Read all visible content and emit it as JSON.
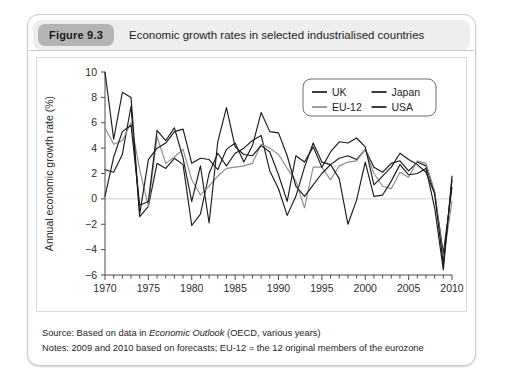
{
  "figure": {
    "badge": "Figure 9.3",
    "title": "Economic growth rates in selected industrialised countries"
  },
  "footer": {
    "source_prefix": "Source: Based on data in ",
    "source_italic": "Economic Outlook",
    "source_suffix": " (OECD, various years)",
    "notes": "Notes: 2009 and 2010 based on forecasts; EU-12 = the 12 original members of the eurozone"
  },
  "legend": {
    "position": "top-right",
    "entries": [
      {
        "label": "UK",
        "color": "#1a1a1a"
      },
      {
        "label": "Japan",
        "color": "#1a1a1a"
      },
      {
        "label": "EU-12",
        "color": "#8c8c8c"
      },
      {
        "label": "USA",
        "color": "#1a1a1a"
      }
    ]
  },
  "chart_data": {
    "type": "line",
    "title": "Economic growth rates in selected industrialised countries",
    "xlabel": "",
    "ylabel": "Annual economic growth rate (%)",
    "xlim": [
      1970,
      2010
    ],
    "ylim": [
      -6,
      10
    ],
    "yticks": [
      -6,
      -4,
      -2,
      0,
      2,
      4,
      6,
      8,
      10
    ],
    "xticks": [
      1970,
      1975,
      1980,
      1985,
      1990,
      1995,
      2000,
      2005,
      2010
    ],
    "xtick_minor_step": 1,
    "grid": false,
    "zero_line": true,
    "x": [
      1970,
      1971,
      1972,
      1973,
      1974,
      1975,
      1976,
      1977,
      1978,
      1979,
      1980,
      1981,
      1982,
      1983,
      1984,
      1985,
      1986,
      1987,
      1988,
      1989,
      1990,
      1991,
      1992,
      1993,
      1994,
      1995,
      1996,
      1997,
      1998,
      1999,
      2000,
      2001,
      2002,
      2003,
      2004,
      2005,
      2006,
      2007,
      2008,
      2009,
      2010
    ],
    "series": [
      {
        "name": "UK",
        "color": "#1a1a1a",
        "values": [
          2.3,
          2.1,
          3.5,
          7.3,
          -1.4,
          -0.6,
          2.8,
          2.4,
          3.2,
          2.7,
          -2.1,
          -1.2,
          2.0,
          3.6,
          2.6,
          3.6,
          4.0,
          4.6,
          5.0,
          2.2,
          0.8,
          -1.3,
          0.2,
          2.5,
          4.4,
          2.9,
          2.7,
          3.2,
          3.4,
          3.1,
          3.9,
          2.5,
          2.1,
          2.8,
          3.0,
          2.2,
          2.9,
          2.6,
          0.5,
          -4.3,
          0.9
        ]
      },
      {
        "name": "EU-12",
        "color": "#8c8c8c",
        "values": [
          5.6,
          4.3,
          4.6,
          6.0,
          2.3,
          -0.6,
          4.9,
          2.8,
          3.3,
          3.9,
          1.5,
          0.3,
          1.0,
          1.8,
          2.4,
          2.5,
          2.6,
          2.8,
          4.3,
          4.0,
          3.5,
          2.4,
          1.4,
          -0.7,
          2.5,
          2.5,
          1.5,
          2.6,
          2.9,
          3.0,
          3.9,
          2.0,
          1.0,
          0.8,
          2.1,
          1.7,
          3.0,
          2.8,
          0.6,
          -4.8,
          -0.2
        ]
      },
      {
        "name": "Japan",
        "color": "#1a1a1a",
        "values": [
          10.0,
          4.7,
          8.4,
          8.0,
          -1.2,
          3.1,
          4.0,
          4.4,
          5.3,
          5.5,
          2.8,
          3.2,
          3.1,
          2.3,
          3.9,
          4.4,
          2.9,
          4.2,
          6.8,
          5.3,
          5.2,
          3.4,
          1.0,
          0.2,
          1.1,
          2.0,
          2.7,
          1.6,
          -2.0,
          -0.1,
          2.9,
          0.2,
          0.3,
          1.4,
          2.7,
          1.9,
          2.0,
          2.4,
          -0.7,
          -5.6,
          1.8
        ]
      },
      {
        "name": "USA",
        "color": "#1a1a1a",
        "values": [
          0.2,
          3.3,
          5.3,
          5.8,
          -0.5,
          -0.2,
          5.4,
          4.6,
          5.6,
          3.2,
          -0.2,
          2.6,
          -1.9,
          4.5,
          7.2,
          4.1,
          3.5,
          3.4,
          4.2,
          3.7,
          1.9,
          -0.2,
          3.4,
          2.9,
          4.1,
          2.5,
          3.7,
          4.5,
          4.4,
          4.8,
          4.1,
          1.1,
          1.8,
          2.5,
          3.6,
          3.1,
          2.7,
          2.1,
          0.4,
          -5.2,
          1.5
        ]
      }
    ]
  }
}
